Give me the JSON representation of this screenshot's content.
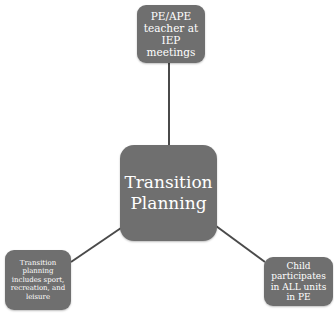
{
  "diagram": {
    "type": "hub-and-spoke",
    "colors": {
      "node_fill": "#6f6f6f",
      "node_text": "#ffffff",
      "connector": "#4a4a4a",
      "background": "#ffffff"
    },
    "center": {
      "label": "Transition Planning"
    },
    "nodes": [
      {
        "position": "top",
        "label": "PE/APE teacher at IEP meetings"
      },
      {
        "position": "bottom-left",
        "label": "Transition planning includes sport, recreation, and leisure"
      },
      {
        "position": "bottom-right",
        "label": "Child participates in ALL units in PE"
      }
    ],
    "edges": [
      {
        "from": "Transition Planning",
        "to": "PE/APE teacher at IEP meetings"
      },
      {
        "from": "Transition Planning",
        "to": "Transition planning includes sport, recreation, and leisure"
      },
      {
        "from": "Transition Planning",
        "to": "Child participates in ALL units in PE"
      }
    ]
  }
}
